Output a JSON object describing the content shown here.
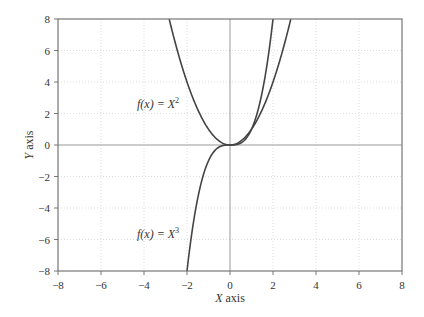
{
  "chart_data": {
    "type": "line",
    "title": "",
    "xlabel": "X axis",
    "ylabel": "Y axis",
    "xlim": [
      -8,
      8
    ],
    "ylim": [
      -8,
      8
    ],
    "xticks": [
      -8,
      -6,
      -4,
      -2,
      0,
      2,
      4,
      6,
      8
    ],
    "yticks": [
      -8,
      -6,
      -4,
      -2,
      0,
      2,
      4,
      6,
      8
    ],
    "grid": true,
    "legend": null,
    "series": [
      {
        "name": "f(x) = X^2",
        "function": "x^2",
        "x": [
          -2.83,
          -2.5,
          -2,
          -1.5,
          -1,
          -0.5,
          0,
          0.5,
          1,
          1.5,
          2,
          2.5,
          2.83
        ],
        "y": [
          8,
          6.25,
          4,
          2.25,
          1,
          0.25,
          0,
          0.25,
          1,
          2.25,
          4,
          6.25,
          8
        ]
      },
      {
        "name": "f(x) = X^3",
        "function": "x^3",
        "x": [
          -2,
          -1.5,
          -1,
          -0.5,
          0,
          0.5,
          1,
          1.5,
          2
        ],
        "y": [
          -8,
          -3.375,
          -1,
          -0.125,
          0,
          0.125,
          1,
          3.375,
          8
        ]
      }
    ],
    "annotations": [
      {
        "text_prefix": "f(x) = X",
        "superscript": "2",
        "x": -3.5,
        "y": 2.5
      },
      {
        "text_prefix": "f(x) = X",
        "superscript": "3",
        "x": -3.5,
        "y": -6.2
      }
    ]
  },
  "labels": {
    "x_axis": "X axis",
    "y_axis": "Y axis",
    "annot_sq_prefix": "f(x) = X",
    "annot_sq_sup": "2",
    "annot_cube_prefix": "f(x) = X",
    "annot_cube_sup": "3"
  },
  "colors": {
    "curve": "#444444",
    "frame": "#777777",
    "grid": "#dddddd",
    "zero_line": "#999999"
  }
}
